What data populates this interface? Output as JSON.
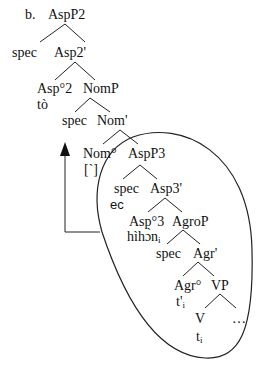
{
  "diagram": {
    "example_label": "b.",
    "nodes": {
      "AspP2": "AspP2",
      "spec1": "spec",
      "Asp2bar": "Asp2'",
      "Asp2head": "Asp°2",
      "to": "tò",
      "NomP": "NomP",
      "spec2": "spec",
      "Nombar": "Nom'",
      "Nomhead": "Nom°",
      "tone": "[`]",
      "AspP3": "AspP3",
      "spec3": "spec",
      "ec": "ec",
      "Asp3bar": "Asp3'",
      "Asp3head": "Asp°3",
      "hihon": "hìhɔ̀n",
      "hihon_sub": "i",
      "AgroP": "AgroP",
      "spec4": "spec",
      "Agrbar": "Agr'",
      "Agrhead": "Agr°",
      "tprime": "t'",
      "tprime_sub": "i",
      "VP": "VP",
      "V": "V",
      "ellipsis": "…",
      "trace": "t",
      "trace_sub": "i"
    },
    "arrow": "movement-arrow from AspP3 domain up to Nom°",
    "ellipse": "circled constituent AspP3"
  }
}
